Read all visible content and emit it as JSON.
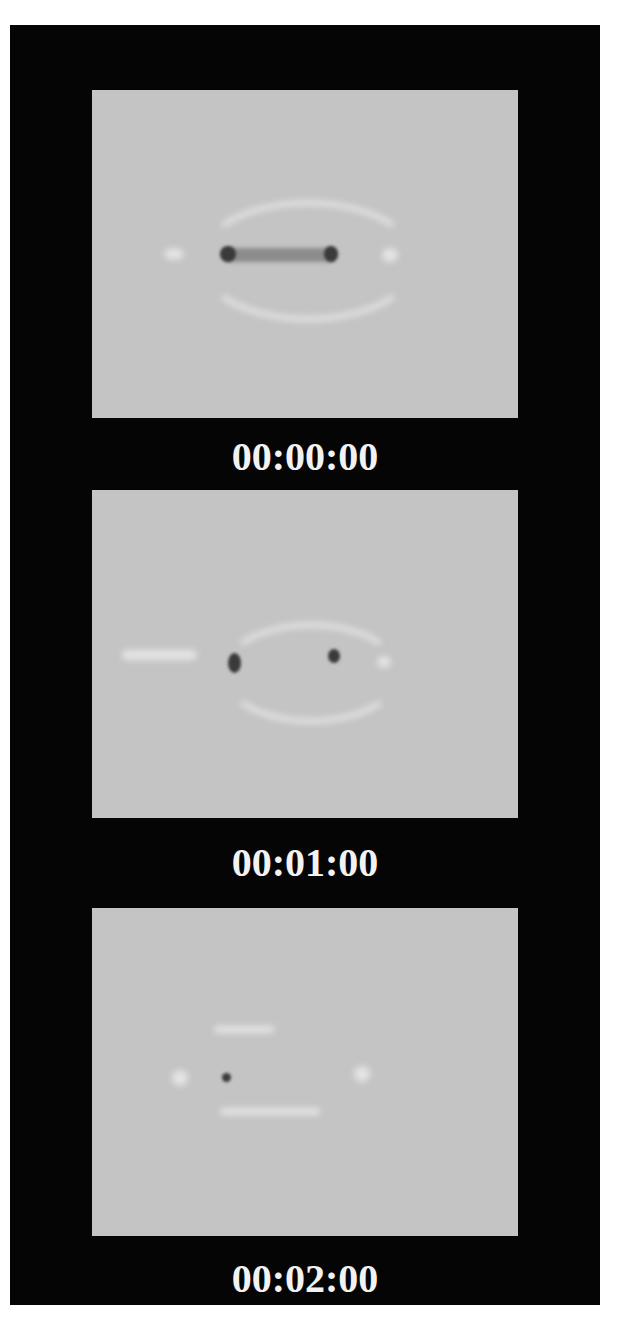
{
  "figure": {
    "background_color": "#050505",
    "panel_color": "#c4c4c4",
    "stamp_color": "#f2f2f2"
  },
  "frames": [
    {
      "timestamp": "00:00:00",
      "description": "elongated dark bar with two dark end spots, bright halo arcs above and below"
    },
    {
      "timestamp": "00:01:00",
      "description": "two separated dark spots inside bright elliptical ring"
    },
    {
      "timestamp": "00:02:00",
      "description": "single small dark dot with faint bright arcs"
    }
  ]
}
